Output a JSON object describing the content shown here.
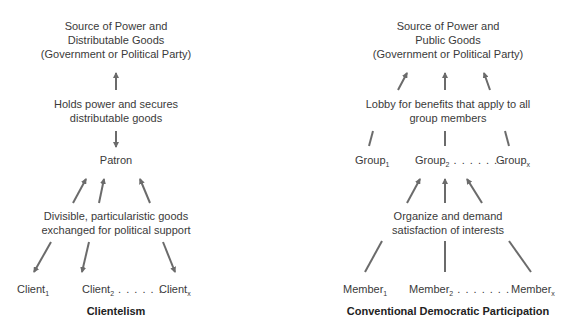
{
  "left": {
    "caption": "Clientelism",
    "source": [
      "Source of Power and",
      "Distributable Goods",
      "(Government or Political Party)"
    ],
    "middle": [
      "Holds power and secures",
      "distributable goods"
    ],
    "patron": "Patron",
    "exchange": [
      "Divisible, particularistic goods",
      "exchanged for political support"
    ],
    "clients": [
      {
        "base": "Client",
        "sub": "1",
        "dots": ""
      },
      {
        "base": "Client",
        "sub": "2",
        "dots": " . . . . . . ."
      },
      {
        "base": "Client",
        "sub": "x",
        "dots": ""
      }
    ]
  },
  "right": {
    "caption": "Conventional Democratic Participation",
    "source": [
      "Source of Power and",
      "Public Goods",
      "(Government or Political Party)"
    ],
    "lobby": [
      "Lobby for benefits that apply to all",
      "group members"
    ],
    "groups": [
      {
        "base": "Group",
        "sub": "1",
        "dots": ""
      },
      {
        "base": "Group",
        "sub": "2",
        "dots": " . . . . . . ."
      },
      {
        "base": "Group",
        "sub": "x",
        "dots": ""
      }
    ],
    "organize": [
      "Organize and demand",
      "satisfaction of interests"
    ],
    "members": [
      {
        "base": "Member",
        "sub": "1",
        "dots": ""
      },
      {
        "base": "Member",
        "sub": "2",
        "dots": " . . . . . . ."
      },
      {
        "base": "Member",
        "sub": "x",
        "dots": ""
      }
    ]
  },
  "colors": {
    "arrow": "#6b6b6b",
    "text": "#3a3a3a"
  }
}
